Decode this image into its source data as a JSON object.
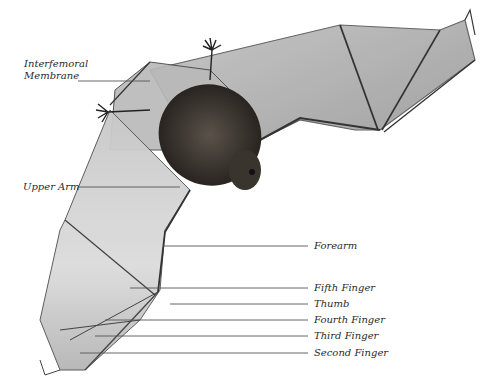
{
  "diagram": {
    "labels": {
      "interfemoral_membrane_line1": "Interfemoral",
      "interfemoral_membrane_line2": "Membrane",
      "upper_arm": "Upper Arm",
      "forearm": "Forearm",
      "fifth_finger": "Fifth Finger",
      "thumb": "Thumb",
      "fourth_finger": "Fourth Finger",
      "third_finger": "Third Finger",
      "second_finger": "Second Finger"
    },
    "colors": {
      "background": "#ffffff",
      "label_text": "#2a2a2a",
      "leader_line": "#555555",
      "membrane": "#c9c9c9",
      "bone": "#333333",
      "fur": "#2e2a26"
    }
  }
}
